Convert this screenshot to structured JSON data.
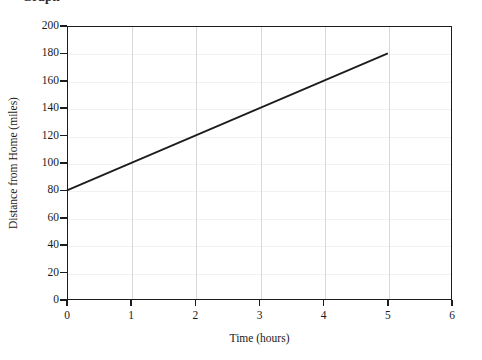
{
  "top_caption": "Graph",
  "chart_data": {
    "type": "line",
    "title": "",
    "xlabel": "Time (hours)",
    "ylabel": "Distance from Home (miles)",
    "xlim": [
      0,
      6
    ],
    "ylim": [
      0,
      200
    ],
    "xticks": [
      0,
      1,
      2,
      3,
      4,
      5,
      6
    ],
    "yticks": [
      0,
      20,
      40,
      60,
      80,
      100,
      120,
      140,
      160,
      180,
      200
    ],
    "xtick_labels": [
      "0",
      "1",
      "2",
      "3",
      "4",
      "5",
      "6"
    ],
    "ytick_labels": [
      "0",
      "20",
      "40",
      "60",
      "80",
      "100",
      "120",
      "140",
      "160",
      "180",
      "200"
    ],
    "grid": "vertical",
    "legend": "none",
    "series": [
      {
        "name": "Distance from Home",
        "color": "#1c1c1c",
        "x": [
          0,
          5
        ],
        "values": [
          80,
          180
        ],
        "points": [
          [
            0,
            80
          ],
          [
            1,
            100
          ],
          [
            2,
            120
          ],
          [
            3,
            140
          ],
          [
            4,
            160
          ],
          [
            5,
            180
          ]
        ],
        "slope_miles_per_hour": 20,
        "intercept_miles": 80
      }
    ]
  }
}
